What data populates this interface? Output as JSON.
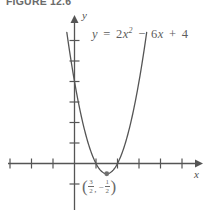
{
  "figure": {
    "caption": "FIGURE 12.6",
    "equation": {
      "lhs": "y",
      "equals": "=",
      "term1_coeff": "2",
      "term1_var": "x",
      "term1_exp": "2",
      "op1": "−",
      "term2_coeff": "6",
      "term2_var": "x",
      "op2": "+",
      "term3": "4",
      "plain": "y = 2x² − 6x + 4"
    },
    "axes": {
      "x_label": "x",
      "y_label": "y"
    },
    "vertex": {
      "open_paren": "(",
      "x_numer": "3",
      "x_denom": "2",
      "comma": ",",
      "minus": "−",
      "y_numer": "1",
      "y_denom": "2",
      "close_paren": ")",
      "plain": "(3/2, −1/2)"
    },
    "colors": {
      "curve": "#555555",
      "axis": "#555555",
      "text": "#5a5a5a",
      "background": "#ffffff"
    }
  },
  "chart_data": {
    "type": "line",
    "title": "FIGURE 12.6",
    "function": "y = 2x^2 - 6x + 4",
    "coefficients": {
      "a": 2,
      "b": -6,
      "c": 4
    },
    "vertex": {
      "x": 1.5,
      "y": -0.5
    },
    "roots": [
      1,
      2
    ],
    "y_intercept": 4,
    "xlabel": "x",
    "ylabel": "y",
    "xlim": [
      -3.5,
      6
    ],
    "ylim": [
      -1.5,
      7
    ],
    "x_ticks": [
      -3,
      -2,
      -1,
      1,
      2,
      3,
      4,
      5
    ],
    "y_ticks": [
      -1,
      1,
      2,
      3,
      4,
      5,
      6
    ],
    "grid": false,
    "legend": false,
    "annotations": [
      {
        "text": "y = 2x² − 6x + 4",
        "x": 2.6,
        "y": 6.3
      },
      {
        "text": "(3/2, −1/2)",
        "x": 1.5,
        "y": -1.1
      }
    ],
    "x": [
      -0.1,
      0.1,
      0.3,
      0.5,
      0.7,
      0.9,
      1.1,
      1.3,
      1.5,
      1.7,
      1.9,
      2.1,
      2.3,
      2.5,
      2.7,
      2.9,
      3.1
    ],
    "values": [
      4.62,
      3.42,
      2.38,
      1.5,
      0.78,
      0.22,
      -0.18,
      -0.42,
      -0.5,
      -0.42,
      -0.18,
      0.22,
      0.78,
      1.5,
      2.38,
      3.42,
      4.62
    ]
  }
}
